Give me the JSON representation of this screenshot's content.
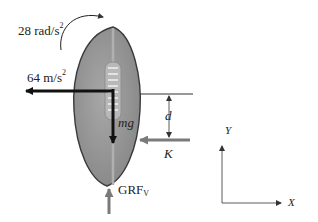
{
  "diagram": {
    "labels": {
      "angular_accel_value": "28 rad/s",
      "angular_accel_exp": "2",
      "linear_accel_value": "64 m/s",
      "linear_accel_exp": "2",
      "weight": "mg",
      "distance": "d",
      "kick_force": "K",
      "grf_main": "GRF",
      "grf_sub": "V",
      "axis_y": "Y",
      "axis_x": "X"
    },
    "colors": {
      "ball_fill": "#9a9a9a",
      "ball_outline": "#3a3a3a",
      "laces_panel": "#b8b8b8",
      "arrow_dark": "#111111",
      "arrow_gray": "#7a7a7a",
      "text": "#222222"
    }
  }
}
